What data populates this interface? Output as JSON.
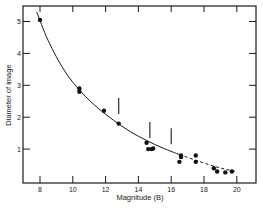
{
  "chart_data": {
    "type": "scatter",
    "title": "",
    "xlabel": "Magnitude (B)",
    "ylabel": "Diameter of image",
    "xlim": [
      7,
      21
    ],
    "ylim": [
      0,
      5.5
    ],
    "x_ticks": [
      8,
      10,
      12,
      14,
      16,
      18,
      20
    ],
    "y_ticks": [
      1,
      2,
      3,
      4,
      5
    ],
    "grid": false,
    "legend": null,
    "series": [
      {
        "name": "observed images",
        "kind": "points",
        "points": [
          {
            "x": 8.0,
            "y": 5.05
          },
          {
            "x": 10.4,
            "y": 2.9
          },
          {
            "x": 10.4,
            "y": 2.8
          },
          {
            "x": 11.9,
            "y": 2.2
          },
          {
            "x": 12.8,
            "y": 1.8
          },
          {
            "x": 14.5,
            "y": 1.2
          },
          {
            "x": 14.6,
            "y": 1.0
          },
          {
            "x": 14.8,
            "y": 1.0
          },
          {
            "x": 14.9,
            "y": 1.02
          },
          {
            "x": 16.6,
            "y": 0.8
          },
          {
            "x": 16.6,
            "y": 0.75
          },
          {
            "x": 16.5,
            "y": 0.6
          },
          {
            "x": 17.5,
            "y": 0.8
          },
          {
            "x": 17.5,
            "y": 0.6
          },
          {
            "x": 18.6,
            "y": 0.4
          },
          {
            "x": 18.8,
            "y": 0.3
          },
          {
            "x": 19.3,
            "y": 0.27
          },
          {
            "x": 19.7,
            "y": 0.3
          }
        ]
      },
      {
        "name": "fitted curve (solid)",
        "kind": "line",
        "style": "solid",
        "points": [
          {
            "x": 7.8,
            "y": 5.3
          },
          {
            "x": 8.5,
            "y": 4.4
          },
          {
            "x": 9.5,
            "y": 3.45
          },
          {
            "x": 10.5,
            "y": 2.8
          },
          {
            "x": 11.5,
            "y": 2.3
          },
          {
            "x": 12.5,
            "y": 1.9
          },
          {
            "x": 13.5,
            "y": 1.55
          },
          {
            "x": 14.5,
            "y": 1.27
          },
          {
            "x": 15.5,
            "y": 1.03
          },
          {
            "x": 16.5,
            "y": 0.83
          }
        ]
      },
      {
        "name": "extrapolated curve (dashed)",
        "kind": "line",
        "style": "dashed",
        "points": [
          {
            "x": 16.5,
            "y": 0.83
          },
          {
            "x": 17.5,
            "y": 0.65
          },
          {
            "x": 18.5,
            "y": 0.48
          },
          {
            "x": 19.3,
            "y": 0.37
          },
          {
            "x": 20.0,
            "y": 0.3
          }
        ]
      },
      {
        "name": "vertical markers",
        "kind": "segments",
        "segments": [
          {
            "x": 12.8,
            "y1": 2.1,
            "y2": 2.6
          },
          {
            "x": 14.7,
            "y1": 1.35,
            "y2": 1.85
          },
          {
            "x": 16.0,
            "y1": 1.15,
            "y2": 1.65
          }
        ]
      }
    ]
  },
  "axes": {
    "x_label": "Magnitude (B)",
    "y_label": "Diameter of image",
    "x_tick_labels": [
      "8",
      "10",
      "12",
      "14",
      "16",
      "18",
      "20"
    ],
    "y_tick_labels": [
      "1",
      "2",
      "3",
      "4",
      "5"
    ]
  }
}
